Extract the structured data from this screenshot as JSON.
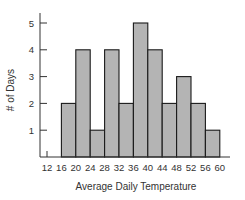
{
  "chart_data": {
    "type": "bar",
    "subtype": "histogram",
    "title": "",
    "xlabel": "Average Daily Temperature",
    "ylabel": "# of Days",
    "bin_edges": [
      16,
      20,
      24,
      28,
      32,
      36,
      40,
      44,
      48,
      52,
      56,
      60
    ],
    "categories": [
      "16-20",
      "20-24",
      "24-28",
      "28-32",
      "32-36",
      "36-40",
      "40-44",
      "44-48",
      "48-52",
      "52-56",
      "56-60"
    ],
    "values": [
      2,
      4,
      1,
      4,
      2,
      5,
      4,
      2,
      3,
      2,
      1
    ],
    "x_ticks": [
      12,
      16,
      20,
      24,
      28,
      32,
      36,
      40,
      44,
      48,
      52,
      56,
      60
    ],
    "y_ticks": [
      1,
      2,
      3,
      4,
      5
    ],
    "xlim": [
      12,
      60
    ],
    "ylim": [
      0,
      5
    ],
    "grid": false,
    "legend": null,
    "colors": {
      "bar_fill": "#b4b4b4",
      "bar_stroke": "#1a1a1a",
      "axis": "#333333"
    }
  }
}
